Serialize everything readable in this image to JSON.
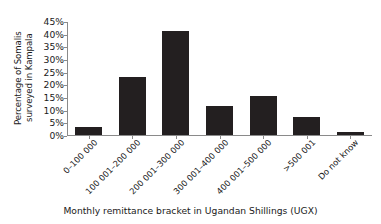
{
  "chart_data": {
    "type": "bar",
    "title": "",
    "xlabel": "Monthly remittance bracket in Ugandan Shillings (UGX)",
    "ylabel_lines": [
      "Percentage of Somalis",
      "surveyed in Kampala"
    ],
    "ylabel": "Percentage of Somalis surveyed in Kampala",
    "categories": [
      "0–100 000",
      "100 001–200 000",
      "200 001–300 000",
      "300 001–400 000",
      "400 001–500 000",
      ">500 001",
      "Do not know"
    ],
    "values": [
      3,
      23,
      41,
      11.5,
      15.5,
      7,
      1
    ],
    "ylim": [
      0,
      45
    ],
    "ytick_values": [
      0,
      5,
      10,
      15,
      20,
      25,
      30,
      35,
      40,
      45
    ],
    "ytick_labels": [
      "0%",
      "5%",
      "10%",
      "15%",
      "20%",
      "25%",
      "30%",
      "35%",
      "40%",
      "45%"
    ],
    "grid": false,
    "legend": "none",
    "bar_color": "#231f20",
    "axis_color": "#8a8a8a"
  }
}
